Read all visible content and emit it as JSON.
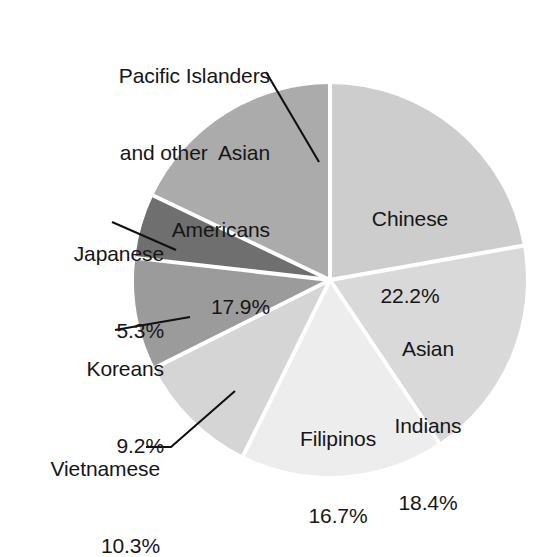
{
  "chart_data": {
    "type": "pie",
    "title": "",
    "subtitle": "",
    "xlabel": "",
    "ylabel": "",
    "legend_position": "none",
    "grid": false,
    "units": "percent",
    "start_angle_deg": 0,
    "direction": "clockwise",
    "categories": [
      "Chinese",
      "Asian Indians",
      "Filipinos",
      "Vietnamese",
      "Koreans",
      "Japanese",
      "Pacific Islanders and other  Asian Americans"
    ],
    "values": [
      22.2,
      18.4,
      16.7,
      10.3,
      9.2,
      5.3,
      17.9
    ],
    "colors": [
      "#cdcdcd",
      "#d9d9d9",
      "#ededed",
      "#d5d5d5",
      "#9b9b9b",
      "#6f6f6f",
      "#ababab"
    ],
    "slices": [
      {
        "id": "chinese",
        "label": "Chinese",
        "value": 22.2,
        "value_text": "22.2%",
        "color": "#cdcdcd",
        "label_placement": "inside",
        "label_lines": [
          "Chinese",
          "22.2%"
        ]
      },
      {
        "id": "asian-indians",
        "label": "Asian Indians",
        "value": 18.4,
        "value_text": "18.4%",
        "color": "#d9d9d9",
        "label_placement": "inside",
        "label_lines": [
          "Asian",
          "Indians",
          "18.4%"
        ]
      },
      {
        "id": "filipinos",
        "label": "Filipinos",
        "value": 16.7,
        "value_text": "16.7%",
        "color": "#ededed",
        "label_placement": "inside",
        "label_lines": [
          "Filipinos",
          "16.7%"
        ]
      },
      {
        "id": "vietnamese",
        "label": "Vietnamese",
        "value": 10.3,
        "value_text": "10.3%",
        "color": "#d5d5d5",
        "label_placement": "outside",
        "label_lines": [
          "Vietnamese",
          "10.3%"
        ]
      },
      {
        "id": "koreans",
        "label": "Koreans",
        "value": 9.2,
        "value_text": "9.2%",
        "color": "#9b9b9b",
        "label_placement": "outside",
        "label_lines": [
          "Koreans",
          "9.2%"
        ]
      },
      {
        "id": "japanese",
        "label": "Japanese",
        "value": 5.3,
        "value_text": "5.3%",
        "color": "#6f6f6f",
        "label_placement": "outside",
        "label_lines": [
          "Japanese",
          "5.3%"
        ]
      },
      {
        "id": "pacific-islanders",
        "label": "Pacific Islanders and other  Asian Americans",
        "value": 17.9,
        "value_text": "17.9%",
        "color": "#ababab",
        "label_placement": "outside",
        "label_lines": [
          "Pacific Islanders",
          "and other  Asian",
          "Americans",
          "17.9%"
        ]
      }
    ]
  },
  "labels": {
    "pacific": {
      "line1": "Pacific Islanders",
      "line2": "and other  Asian",
      "line3": "Americans",
      "line4": "17.9%"
    },
    "japanese": {
      "line1": "Japanese",
      "line2": "5.3%"
    },
    "koreans": {
      "line1": "Koreans",
      "line2": "9.2%"
    },
    "vietnamese": {
      "line1": "Vietnamese",
      "line2": "10.3%"
    },
    "chinese": {
      "line1": "Chinese",
      "line2": "22.2%"
    },
    "asian_indians": {
      "line1": "Asian",
      "line2": "Indians",
      "line3": "18.4%"
    },
    "filipinos": {
      "line1": "Filipinos",
      "line2": "16.7%"
    }
  },
  "style": {
    "background": "#ffffff",
    "text_color": "#161616",
    "divider_color": "#ffffff",
    "leader_line_color": "#111111"
  }
}
